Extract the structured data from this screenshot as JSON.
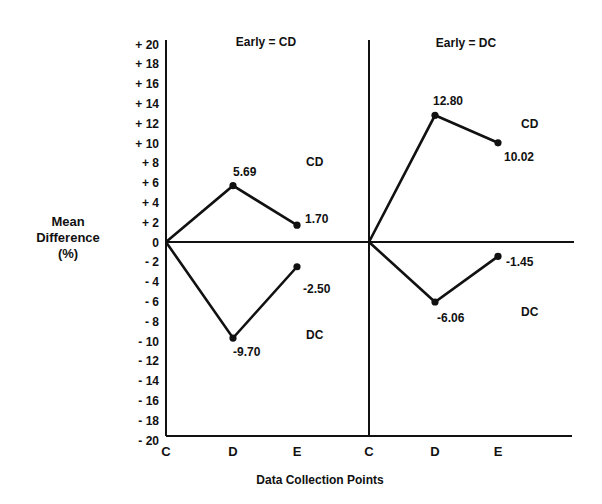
{
  "chart_data": {
    "type": "line",
    "title": "",
    "xlabel": "Data Collection Points",
    "ylabel": "Mean Difference (%)",
    "ylabel_lines": [
      "Mean",
      "Difference",
      "(%)"
    ],
    "ylim": [
      -20,
      20
    ],
    "yticks": [
      "+ 20",
      "+ 18",
      "+ 16",
      "+ 14",
      "+ 12",
      "+ 10",
      "+ 8",
      "+ 6",
      "+ 4",
      "+ 2",
      "0",
      "- 2",
      "- 4",
      "- 6",
      "- 8",
      "- 10",
      "- 12",
      "- 14",
      "- 16",
      "- 18",
      "- 20"
    ],
    "ytick_values": [
      20,
      18,
      16,
      14,
      12,
      10,
      8,
      6,
      4,
      2,
      0,
      -2,
      -4,
      -6,
      -8,
      -10,
      -12,
      -14,
      -16,
      -18,
      -20
    ],
    "grid": false,
    "panels": [
      {
        "title": "Early = CD",
        "categories": [
          "C",
          "D",
          "E"
        ],
        "series": [
          {
            "name": "CD",
            "values": [
              0,
              5.69,
              1.7
            ],
            "labels": [
              "",
              "5.69",
              "1.70"
            ]
          },
          {
            "name": "DC",
            "values": [
              0,
              -9.7,
              -2.5
            ],
            "labels": [
              "",
              "-9.70",
              "-2.50"
            ]
          }
        ]
      },
      {
        "title": "Early = DC",
        "categories": [
          "C",
          "D",
          "E"
        ],
        "series": [
          {
            "name": "CD",
            "values": [
              0,
              12.8,
              10.02
            ],
            "labels": [
              "",
              "12.80",
              "10.02"
            ]
          },
          {
            "name": "DC",
            "values": [
              0,
              -6.06,
              -1.45
            ],
            "labels": [
              "",
              "-6.06",
              "-1.45"
            ]
          }
        ]
      }
    ]
  },
  "colors": {
    "line": "#111111",
    "background": "#ffffff"
  }
}
